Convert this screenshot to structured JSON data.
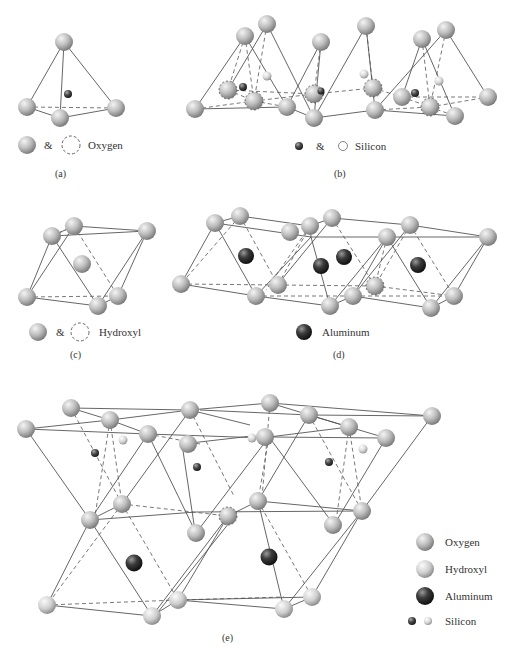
{
  "figure": {
    "panels": [
      {
        "id": "a",
        "caption": "(a)",
        "legend": [
          {
            "symbol": "oxygen-sphere",
            "text": "&"
          },
          {
            "symbol": "dashed-circle",
            "text": "Oxygen"
          }
        ]
      },
      {
        "id": "b",
        "caption": "(b)",
        "legend": [
          {
            "symbol": "silicon-dark-sphere",
            "text": "&"
          },
          {
            "symbol": "silicon-light-circle",
            "text": "Silicon"
          }
        ]
      },
      {
        "id": "c",
        "caption": "(c)",
        "legend": [
          {
            "symbol": "hydroxyl-sphere",
            "text": "&"
          },
          {
            "symbol": "dashed-circle",
            "text": "Hydroxyl"
          }
        ]
      },
      {
        "id": "d",
        "caption": "(d)",
        "legend": [
          {
            "symbol": "aluminum-sphere",
            "text": "Aluminum"
          }
        ]
      },
      {
        "id": "e",
        "caption": "(e)",
        "legend": [
          {
            "symbol": "oxygen-sphere",
            "text": "Oxygen"
          },
          {
            "symbol": "hydroxyl-sphere",
            "text": "Hydroxyl"
          },
          {
            "symbol": "aluminum-sphere",
            "text": "Aluminum"
          },
          {
            "symbol": "silicon-pair",
            "text": "Silicon"
          }
        ]
      }
    ],
    "labels": {
      "a_amp": "&",
      "a_name": "Oxygen",
      "a_cap": "(a)",
      "b_amp": "&",
      "b_name": "Silicon",
      "b_cap": "(b)",
      "c_amp": "&",
      "c_name": "Hydroxyl",
      "c_cap": "(c)",
      "d_name": "Aluminum",
      "d_cap": "(d)",
      "e_cap": "(e)",
      "e_oxygen": "Oxygen",
      "e_hydroxyl": "Hydroxyl",
      "e_aluminum": "Aluminum",
      "e_silicon": "Silicon"
    },
    "colors": {
      "oxygen": "#b8b8b8",
      "aluminum": "#3a3a3a",
      "silicon_dark": "#4a4a4a",
      "silicon_light": "#d0d0d0",
      "bond": "#555555"
    }
  }
}
